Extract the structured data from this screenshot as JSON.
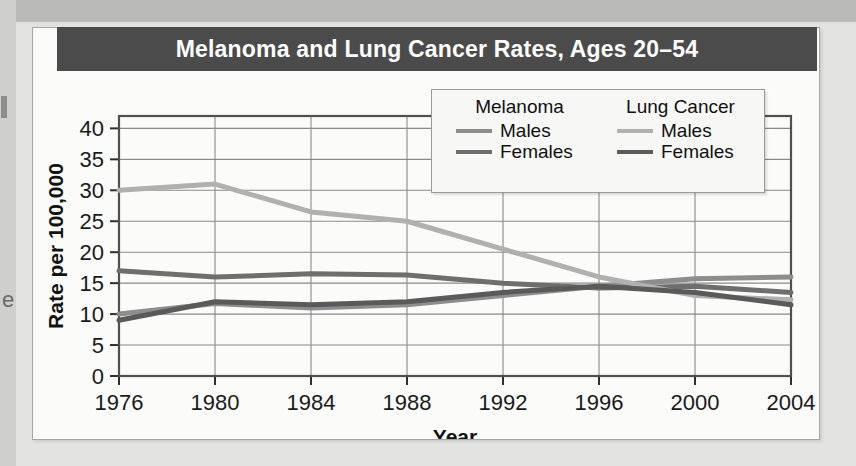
{
  "title": "Melanoma and Lung Cancer Rates, Ages 20–54",
  "axes": {
    "ylabel": "Rate per 100,000",
    "xlabel": "Year",
    "yticks": [
      "0",
      "5",
      "10",
      "15",
      "20",
      "25",
      "30",
      "35",
      "40"
    ],
    "xticks": [
      "1976",
      "1980",
      "1984",
      "1988",
      "1992",
      "1996",
      "2000",
      "2004"
    ]
  },
  "legend": {
    "groups": [
      {
        "heading": "Melanoma",
        "entries": [
          {
            "label": "Males",
            "color": "#8d8d8d"
          },
          {
            "label": "Females",
            "color": "#6e6e6e"
          }
        ]
      },
      {
        "heading": "Lung Cancer",
        "entries": [
          {
            "label": "Males",
            "color": "#b0b0b0"
          },
          {
            "label": "Females",
            "color": "#5a5a5a"
          }
        ]
      }
    ]
  },
  "colors": {
    "banner": "#4b4b4b",
    "card": "#fbfbf9",
    "page": "#e3e3e1",
    "grid": "#8a8a8a",
    "frame": "#4f4f4f"
  },
  "chart_data": {
    "type": "line",
    "title": "Melanoma and Lung Cancer Rates, Ages 20–54",
    "xlabel": "Year",
    "ylabel": "Rate per 100,000",
    "x": [
      1976,
      1980,
      1984,
      1988,
      1992,
      1996,
      2000,
      2004
    ],
    "xlim": [
      1976,
      2004
    ],
    "ylim": [
      0,
      42
    ],
    "ytick_values": [
      0,
      5,
      10,
      15,
      20,
      25,
      30,
      35,
      40
    ],
    "grid": true,
    "legend_position": "upper-right-inside",
    "series": [
      {
        "name": "Melanoma Males",
        "color": "#8d8d8d",
        "values": [
          10.0,
          11.7,
          11.0,
          11.5,
          13.0,
          14.5,
          15.7,
          16.0
        ]
      },
      {
        "name": "Melanoma Females",
        "color": "#6e6e6e",
        "values": [
          17.0,
          16.0,
          16.5,
          16.3,
          15.0,
          14.2,
          14.5,
          13.5
        ]
      },
      {
        "name": "Lung Cancer Males",
        "color": "#b0b0b0",
        "values": [
          30.0,
          31.0,
          26.5,
          25.0,
          20.5,
          16.0,
          13.0,
          12.3
        ]
      },
      {
        "name": "Lung Cancer Females",
        "color": "#5a5a5a",
        "values": [
          9.0,
          12.0,
          11.5,
          12.0,
          13.5,
          14.5,
          13.5,
          11.5
        ]
      }
    ]
  }
}
